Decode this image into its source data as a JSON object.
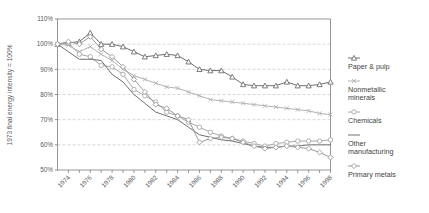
{
  "chart_data": {
    "type": "line",
    "title": "",
    "xlabel": "",
    "ylabel": "1973 final energy intensity = 100%",
    "ylim": [
      50,
      110
    ],
    "ytick_labels": [
      "110%",
      "100%",
      "90%",
      "80%",
      "70%",
      "60%",
      "50%"
    ],
    "ytick_values": [
      110,
      100,
      90,
      80,
      70,
      60,
      50
    ],
    "grid": "horizontal dashed gridlines at 100, 90, 80, 70, 60",
    "legend_position": "right",
    "x": [
      1973,
      1974,
      1975,
      1976,
      1977,
      1978,
      1979,
      1980,
      1981,
      1982,
      1983,
      1984,
      1985,
      1986,
      1987,
      1988,
      1989,
      1990,
      1991,
      1992,
      1993,
      1994,
      1995,
      1996,
      1997,
      1998
    ],
    "xtick_labels": [
      "1974",
      "1976",
      "1978",
      "1980",
      "1982",
      "1984",
      "1986",
      "1988",
      "1990",
      "1992",
      "1994",
      "1996",
      "1998"
    ],
    "xtick_values": [
      1974,
      1976,
      1978,
      1980,
      1982,
      1984,
      1986,
      1988,
      1990,
      1992,
      1994,
      1996,
      1998
    ],
    "series": [
      {
        "name": "Paper & pulp",
        "marker": "triangle",
        "color": "#6e6e6e",
        "values": [
          100,
          100.5,
          101,
          104.5,
          100,
          100,
          99,
          97,
          95,
          95.5,
          96,
          95.5,
          93,
          90,
          89.5,
          89.5,
          87,
          84,
          83.5,
          83.5,
          83.5,
          85,
          83.5,
          83.5,
          84,
          85
        ]
      },
      {
        "name": "Nonmetallic minerals",
        "marker": "cross",
        "color": "#b3b3b3",
        "values": [
          100,
          99.5,
          97,
          99,
          96,
          93.5,
          90,
          87.5,
          86,
          84.5,
          83,
          82.5,
          81,
          79.5,
          78,
          77.5,
          77,
          76.5,
          76,
          75.5,
          75,
          74.5,
          74,
          73.5,
          72.5,
          72
        ]
      },
      {
        "name": "Chemicals",
        "marker": "circle",
        "color": "#a8a8a8",
        "values": [
          100,
          100.5,
          96,
          95,
          91.5,
          91,
          88,
          82,
          79.5,
          77,
          73,
          71.5,
          69,
          67,
          65,
          63.5,
          62.5,
          61.5,
          60.5,
          59.5,
          60.5,
          61,
          61.5,
          61.5,
          61.5,
          62
        ]
      },
      {
        "name": "Other manufacturing",
        "marker": "none",
        "color": "#707070",
        "values": [
          100,
          97,
          94,
          94,
          93.5,
          88,
          85,
          80,
          76.5,
          73,
          71.5,
          70,
          67,
          64,
          63,
          62,
          61.5,
          60.5,
          59.5,
          59,
          59,
          59.5,
          59.5,
          60,
          60,
          60
        ]
      },
      {
        "name": "Primary metals",
        "marker": "diamond",
        "color": "#9a9a9a",
        "values": [
          100,
          101,
          100,
          103,
          98,
          95,
          91,
          86,
          81,
          76,
          74.5,
          71.5,
          70,
          61,
          62.5,
          63,
          62.5,
          61,
          59.5,
          58.5,
          59,
          59.5,
          59,
          58.5,
          57,
          55
        ]
      }
    ]
  },
  "legend": {
    "items": [
      {
        "label": "Paper & pulp",
        "marker": "triangle",
        "color": "#6e6e6e"
      },
      {
        "label": "Nonmetallic minerals",
        "marker": "cross",
        "color": "#b3b3b3"
      },
      {
        "label": "Chemicals",
        "marker": "circle",
        "color": "#a8a8a8"
      },
      {
        "label": "Other manufacturing",
        "marker": "none",
        "color": "#707070"
      },
      {
        "label": "Primary metals",
        "marker": "diamond",
        "color": "#9a9a9a"
      }
    ]
  }
}
